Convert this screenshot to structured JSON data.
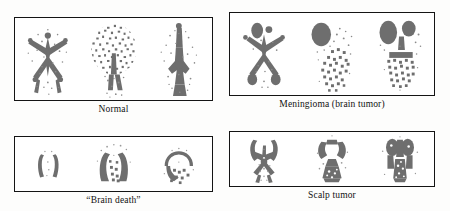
{
  "figure": {
    "background_color": "#fdfdfc",
    "ink_color": "#6d6d6d",
    "border_color": "#141414",
    "panels": [
      {
        "id": "normal",
        "caption": "Normal",
        "position": "top-left",
        "views": [
          "anterior",
          "lateral",
          "posterior"
        ],
        "description": "Symmetric vascular pattern with no focal uptake"
      },
      {
        "id": "meningioma",
        "caption": "Meningioma (brain tumor)",
        "position": "top-right",
        "views": [
          "anterior",
          "lateral",
          "posterior"
        ],
        "description": "Dense focal uptake at parasagittal region"
      },
      {
        "id": "brain-death",
        "caption": "“Brain death”",
        "position": "bottom-left",
        "views": [
          "anterior",
          "lateral",
          "posterior"
        ],
        "description": "Absent intracranial perfusion, scalp activity only"
      },
      {
        "id": "scalp-tumor",
        "caption": "Scalp tumor",
        "position": "bottom-right",
        "views": [
          "anterior",
          "lateral",
          "posterior"
        ],
        "description": "Superficial uptake outside the cranial vault"
      }
    ]
  }
}
